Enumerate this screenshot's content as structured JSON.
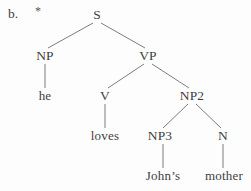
{
  "figure": {
    "item_label": "b.",
    "grammaticality_marker": "*",
    "marker_meaning": "ungrammatical",
    "type": "syntax-tree",
    "background_color": "#fdfdfd",
    "line_color": "#6e6e6e",
    "text_color": "#3f3f3f"
  },
  "tree": {
    "nodes": [
      {
        "id": "S",
        "label": "S",
        "kind": "category",
        "x": 97,
        "y": 15
      },
      {
        "id": "NP",
        "label": "NP",
        "kind": "category",
        "x": 45,
        "y": 56
      },
      {
        "id": "VP",
        "label": "VP",
        "kind": "category",
        "x": 148,
        "y": 56
      },
      {
        "id": "he",
        "label": "he",
        "kind": "terminal",
        "x": 45,
        "y": 96
      },
      {
        "id": "V",
        "label": "V",
        "kind": "category",
        "x": 105,
        "y": 96
      },
      {
        "id": "NP2",
        "label": "NP2",
        "kind": "category",
        "x": 192,
        "y": 96
      },
      {
        "id": "loves",
        "label": "loves",
        "kind": "terminal",
        "x": 105,
        "y": 136
      },
      {
        "id": "NP3",
        "label": "NP3",
        "kind": "category",
        "x": 160,
        "y": 136
      },
      {
        "id": "N",
        "label": "N",
        "kind": "category",
        "x": 223,
        "y": 136
      },
      {
        "id": "johns",
        "label": "John’s",
        "kind": "terminal",
        "x": 163,
        "y": 176
      },
      {
        "id": "mother",
        "label": "mother",
        "kind": "terminal",
        "x": 224,
        "y": 176
      }
    ],
    "edges": [
      {
        "from": "S",
        "to": "NP",
        "x1": 93,
        "y1": 23,
        "x2": 48,
        "y2": 48
      },
      {
        "from": "S",
        "to": "VP",
        "x1": 101,
        "y1": 23,
        "x2": 145,
        "y2": 48
      },
      {
        "from": "NP",
        "to": "he",
        "x1": 45,
        "y1": 64,
        "x2": 45,
        "y2": 88
      },
      {
        "from": "VP",
        "to": "V",
        "x1": 144,
        "y1": 64,
        "x2": 108,
        "y2": 88
      },
      {
        "from": "VP",
        "to": "NP2",
        "x1": 152,
        "y1": 64,
        "x2": 189,
        "y2": 88
      },
      {
        "from": "V",
        "to": "loves",
        "x1": 105,
        "y1": 104,
        "x2": 105,
        "y2": 128
      },
      {
        "from": "NP2",
        "to": "NP3",
        "x1": 188,
        "y1": 104,
        "x2": 163,
        "y2": 128
      },
      {
        "from": "NP2",
        "to": "N",
        "x1": 196,
        "y1": 104,
        "x2": 221,
        "y2": 128
      },
      {
        "from": "NP3",
        "to": "johns",
        "x1": 163,
        "y1": 144,
        "x2": 163,
        "y2": 168
      },
      {
        "from": "N",
        "to": "mother",
        "x1": 223,
        "y1": 144,
        "x2": 223,
        "y2": 168
      }
    ]
  }
}
